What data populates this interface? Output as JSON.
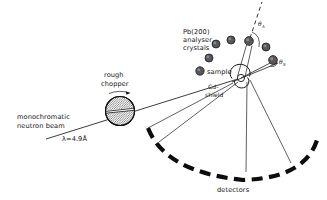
{
  "diagram": {
    "background_color": "#ffffff",
    "ink_color": "#141414",
    "crystal_fill_color": "#58585c",
    "labels": {
      "analyser_line1": "Pb(200)",
      "analyser_line2": "analyser",
      "analyser_line3": "crystals",
      "sample": "sample",
      "shield_line1": "Cd-",
      "shield_line2": "shield",
      "chopper_line1": "rough",
      "chopper_line2": "chopper",
      "beam_line1": "monochromatic",
      "beam_line2": "neutron beam",
      "wavelength": "λ=4.9Å",
      "detectors": "detectors"
    },
    "angles": [
      {
        "name": "angle-theta-a",
        "symbol": "θ",
        "subscript": "A",
        "x": 258,
        "y": 24
      },
      {
        "name": "angle-theta-s",
        "symbol": "θ",
        "subscript": "S",
        "x": 278,
        "y": 62
      }
    ],
    "analyser_crystals": [
      {
        "id": "crystal-1",
        "cx": 216,
        "cy": 44,
        "r": 4.0
      },
      {
        "id": "crystal-2",
        "cx": 231,
        "cy": 40,
        "r": 4.0
      },
      {
        "id": "crystal-3",
        "cx": 249,
        "cy": 41,
        "r": 4.4
      },
      {
        "id": "crystal-4",
        "cx": 266,
        "cy": 47,
        "r": 4.0
      },
      {
        "id": "crystal-5",
        "cx": 209,
        "cy": 58,
        "r": 4.0
      },
      {
        "id": "crystal-6",
        "cx": 200,
        "cy": 71,
        "r": 4.2
      },
      {
        "id": "crystal-7",
        "cx": 273,
        "cy": 60,
        "r": 4.4
      }
    ],
    "chopper": {
      "cx": 120,
      "cy": 111,
      "r": 14.5,
      "rotation_arrow": "counter-clockwise"
    },
    "sample_position": {
      "cx": 241,
      "cy": 78,
      "r": 3.6
    },
    "beam": {
      "start_x": 48,
      "start_y": 137,
      "end_x": 241,
      "end_y": 78
    },
    "detector_arc": {
      "center_x": 243,
      "center_y": 60,
      "radius": 118,
      "start_angle_deg": 122,
      "end_angle_deg": 62
    }
  }
}
